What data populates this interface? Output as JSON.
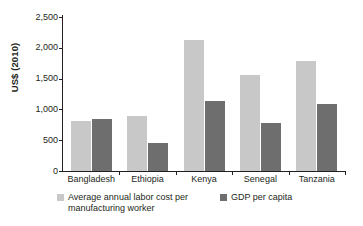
{
  "chart_data": {
    "type": "bar",
    "title": "",
    "subtitle": "",
    "xlabel": "",
    "ylabel": "US$ (2010)",
    "ylim": [
      0,
      2500
    ],
    "yticks": [
      0,
      500,
      1000,
      1500,
      2000,
      2500
    ],
    "ytick_labels": [
      "0",
      "500",
      "1,000",
      "1,500",
      "2,000",
      "2,500"
    ],
    "grid": false,
    "legend_position": "bottom-left",
    "categories": [
      "Bangladesh",
      "Ethiopia",
      "Kenya",
      "Senegal",
      "Tanzania"
    ],
    "series": [
      {
        "name": "Average annual labor cost per manufacturing worker",
        "color": "#c8c8c8",
        "values": [
          820,
          900,
          2120,
          1560,
          1790
        ]
      },
      {
        "name": "GDP per capita",
        "color": "#6e6e6e",
        "values": [
          850,
          460,
          1130,
          780,
          1090
        ]
      }
    ]
  },
  "legend": {
    "entries": [
      {
        "label": "Average annual labor cost per manufacturing worker"
      },
      {
        "label": "GDP per capita"
      }
    ]
  },
  "colors": {
    "series_light": "#c8c8c8",
    "series_dark": "#6e6e6e",
    "axis": "#231f20",
    "background": "#ffffff"
  }
}
